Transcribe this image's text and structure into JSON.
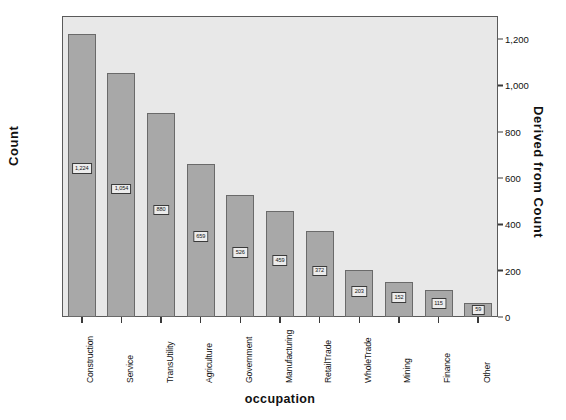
{
  "chart_data": {
    "type": "bar",
    "title": "",
    "xlabel": "occupation",
    "ylabel": "Count",
    "ylabel_right": "Derived from Count",
    "categories": [
      "Construction",
      "Service",
      "TransUtility",
      "Agriculture",
      "Government",
      "Manufacturing",
      "RetailTrade",
      "WholeTrade",
      "Mining",
      "Finance",
      "Other"
    ],
    "values": [
      1224,
      1054,
      880,
      659,
      526,
      459,
      372,
      203,
      152,
      115,
      59
    ],
    "value_labels": [
      "1,224",
      "1,054",
      "880",
      "659",
      "526",
      "459",
      "372",
      "203",
      "152",
      "115",
      "59"
    ],
    "ylim": [
      0,
      1300
    ],
    "yticks": [
      0,
      200,
      400,
      600,
      800,
      1000,
      1200
    ],
    "ytick_labels": [
      "0",
      "200",
      "400",
      "600",
      "800",
      "1,000",
      "1,200"
    ],
    "yticks_right": [
      0,
      200,
      400,
      600,
      800,
      1000,
      1200
    ],
    "ytick_labels_right": [
      "0",
      "200",
      "400",
      "600",
      "800",
      "1,000",
      "1,200"
    ],
    "grid": false,
    "legend": false,
    "colors": {
      "bar_fill": "#a8a8a8",
      "bar_border": "#6a6a6a",
      "plot_background": "#e8e8e8",
      "frame": "#5a5a5a",
      "text": "#111111",
      "label_box_fill": "#ececec",
      "label_box_border": "#3a3a3a"
    }
  }
}
